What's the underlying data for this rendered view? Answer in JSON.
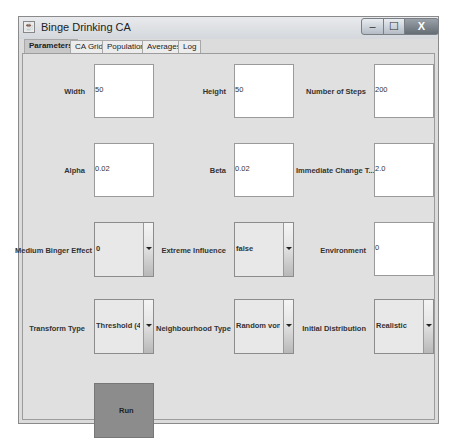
{
  "window": {
    "title": "Binge Drinking CA",
    "buttons": {
      "minimize": "‒",
      "maximize": "☐",
      "close": "X"
    }
  },
  "tabs": [
    {
      "label": "Parameters",
      "active": true
    },
    {
      "label": "CA Grid",
      "active": false
    },
    {
      "label": "Population",
      "active": false
    },
    {
      "label": "Averages",
      "active": false
    },
    {
      "label": "Log",
      "active": false
    }
  ],
  "parameters": {
    "width": {
      "label": "Width",
      "value": "50"
    },
    "height": {
      "label": "Height",
      "value": "50"
    },
    "steps": {
      "label": "Number of Steps",
      "value": "200"
    },
    "alpha": {
      "label": "Alpha",
      "value": "0.02"
    },
    "beta": {
      "label": "Beta",
      "value": "0.02"
    },
    "immediate_change": {
      "label": "Immediate Change T...",
      "value": "2.0"
    },
    "medium_binger": {
      "label": "Medium Binger Effect",
      "value": "0"
    },
    "extreme_influence": {
      "label": "Extreme Influence",
      "value": "false"
    },
    "environment": {
      "label": "Environment",
      "value": "0"
    },
    "transform_type": {
      "label": "Transform Type",
      "value": "Threshold (4)"
    },
    "neighbourhood_type": {
      "label": "Neighbourhood Type",
      "value": "Random von Ne..."
    },
    "initial_distribution": {
      "label": "Initial Distribution",
      "value": "Realistic"
    }
  },
  "run_button": {
    "label": "Run"
  }
}
